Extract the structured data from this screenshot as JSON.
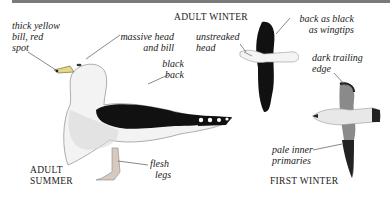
{
  "captions": {
    "adult_summer": [
      "ADULT",
      "SUMMER"
    ],
    "adult_winter": "ADULT WINTER",
    "first_winter": "FIRST WINTER"
  },
  "labels": {
    "bill": [
      "thick yellow",
      "bill, red",
      "spot"
    ],
    "head": [
      "massive head",
      "and bill"
    ],
    "back": [
      "black",
      "back"
    ],
    "legs": [
      "flesh",
      "legs"
    ],
    "unstreaked": [
      "unstreaked",
      "head"
    ],
    "back_wingtips": [
      "back as black",
      "as wingtips"
    ],
    "trailing": [
      "dark trailing",
      "edge"
    ],
    "primaries": [
      "pale inner",
      "primaries"
    ]
  },
  "colors": {
    "ink": "#222222",
    "rule": "#7a7a7a",
    "black_plumage": "#111111",
    "white_plumage": "#f4f4f4",
    "grey_shade": "#bdbdbd"
  }
}
